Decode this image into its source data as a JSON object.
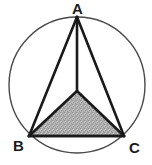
{
  "figure": {
    "background_color": "#ffffff",
    "stroke_color": "#1a1a1a",
    "circle_stroke_color": "#4a4a4a",
    "shade_color": "#a8a8a8",
    "labels": {
      "a": "A",
      "b": "B",
      "c": "C"
    },
    "points": {
      "A": {
        "x": 77,
        "y": 17
      },
      "B": {
        "x": 29,
        "y": 136
      },
      "C": {
        "x": 124,
        "y": 136
      },
      "center": {
        "x": 77,
        "y": 91
      }
    },
    "circle": {
      "cx": 77,
      "cy": 85,
      "r": 68,
      "stroke_width": 1.4
    },
    "outer_triangle": {
      "points": "77,17 29,136 124,136",
      "stroke_width": 2.6
    },
    "median_segment": {
      "x1": 77,
      "y1": 17,
      "x2": 77,
      "y2": 91,
      "stroke_width": 2.6
    },
    "inner_triangle": {
      "points": "77,91 29,136 124,136",
      "stroke_width": 2.6,
      "fill": "#a8a8a8"
    }
  }
}
